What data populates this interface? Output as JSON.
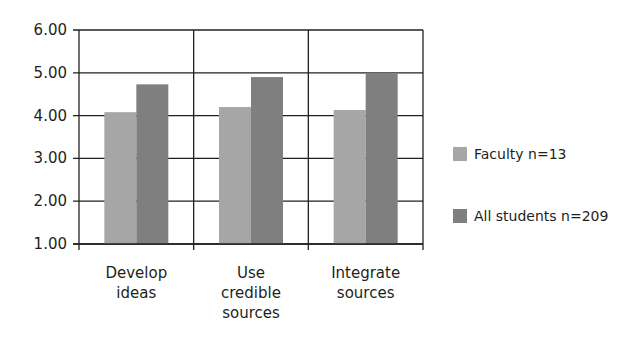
{
  "chart_data": {
    "type": "bar",
    "title": "",
    "xlabel": "",
    "ylabel": "",
    "categories": [
      "Develop ideas",
      "Use credible sources",
      "Integrate sources"
    ],
    "category_lines": [
      [
        "Develop",
        "ideas"
      ],
      [
        "Use",
        "credible",
        "sources"
      ],
      [
        "Integrate",
        "sources"
      ]
    ],
    "series": [
      {
        "name": "Faculty n=13",
        "color": "#a6a6a6",
        "values": [
          4.08,
          4.2,
          4.13
        ]
      },
      {
        "name": "All students n=209",
        "color": "#7f7f7f",
        "values": [
          4.73,
          4.9,
          5.0
        ]
      }
    ],
    "ylim": [
      1.0,
      6.0
    ],
    "yticks": [
      "1.00",
      "2.00",
      "3.00",
      "4.00",
      "5.00",
      "6.00"
    ],
    "grid": true,
    "legend_position": "right"
  }
}
